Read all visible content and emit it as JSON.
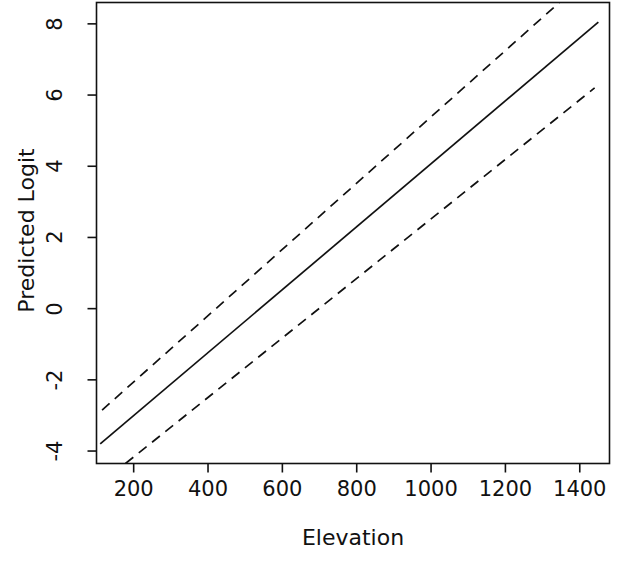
{
  "chart_data": {
    "type": "line",
    "title": "",
    "xlabel": "Elevation",
    "ylabel": "Predicted Logit",
    "xlim": [
      100,
      1480
    ],
    "ylim": [
      -4.35,
      8.6
    ],
    "xticks": [
      200,
      400,
      600,
      800,
      1000,
      1200,
      1400
    ],
    "xtick_labels": [
      "200",
      "400",
      "600",
      "800",
      "1000",
      "1200",
      "1400"
    ],
    "yticks": [
      -4,
      -2,
      0,
      2,
      4,
      6,
      8
    ],
    "ytick_labels": [
      "-4",
      "-2",
      "0",
      "2",
      "4",
      "6",
      "8"
    ],
    "grid": false,
    "legend": "none",
    "box": true,
    "series": [
      {
        "name": "Predicted logit (fit)",
        "style": "solid",
        "color": "#111111",
        "x": [
          110,
          1450
        ],
        "y": [
          -3.8,
          8.05
        ]
      },
      {
        "name": "Upper 95% confidence limit",
        "style": "dashed",
        "color": "#111111",
        "x": [
          115,
          1345
        ],
        "y": [
          -2.85,
          8.6
        ]
      },
      {
        "name": "Lower 95% confidence limit",
        "style": "dashed",
        "color": "#111111",
        "x": [
          178,
          1440
        ],
        "y": [
          -4.35,
          6.2
        ]
      }
    ],
    "axis_color": "#111111",
    "background": "#ffffff"
  }
}
